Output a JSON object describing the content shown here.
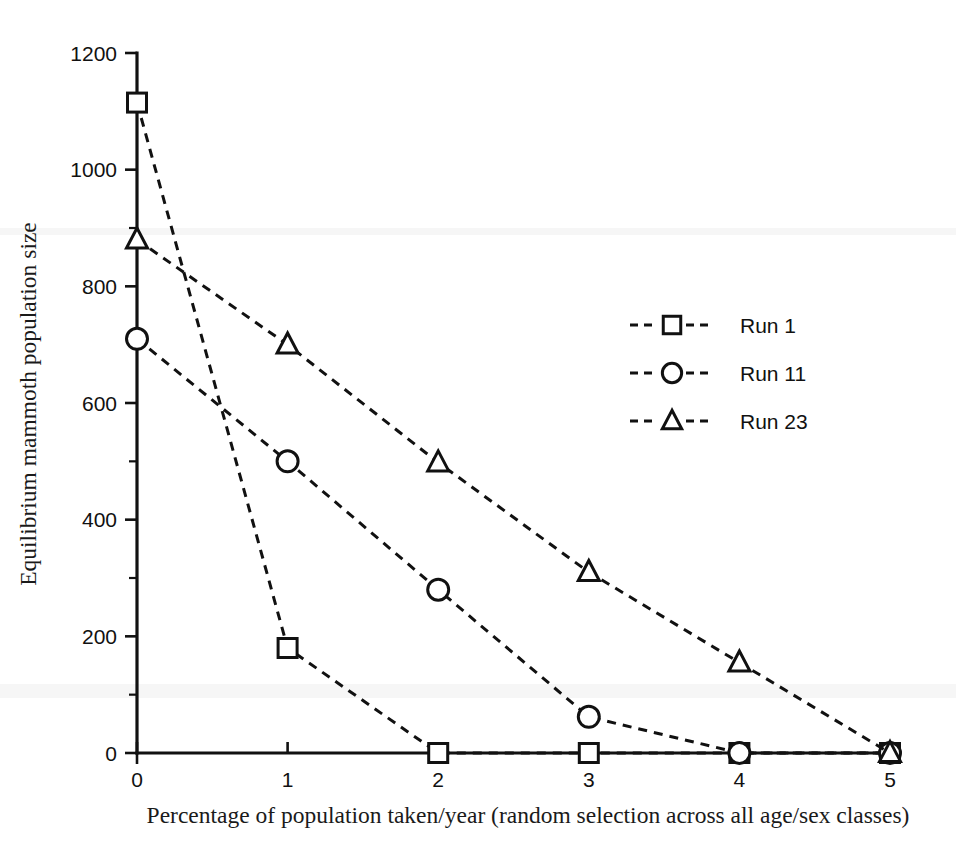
{
  "chart_data": {
    "type": "line",
    "title": "",
    "xlabel": "Percentage of population taken/year (random selection across all age/sex classes)",
    "ylabel": "Equilibrium mammoth population size",
    "x": [
      0,
      1,
      2,
      3,
      4,
      5
    ],
    "xlim": [
      0,
      5
    ],
    "ylim": [
      0,
      1200
    ],
    "xticks": [
      0,
      1,
      2,
      3,
      4,
      5
    ],
    "xticklabels": [
      "0",
      "1",
      "2",
      "3",
      "4",
      "5"
    ],
    "yticks": [
      0,
      200,
      400,
      600,
      800,
      1000,
      1200
    ],
    "yticklabels": [
      "0",
      "200",
      "400",
      "600",
      "800",
      "1000",
      "1200"
    ],
    "yticks_minor": [
      100,
      300,
      500,
      700,
      900,
      1100
    ],
    "grid": false,
    "legend_position": "center-right",
    "series": [
      {
        "name": "Run 1",
        "marker": "square",
        "linestyle": "dashed",
        "values": [
          1115,
          180,
          0,
          0,
          0,
          0
        ]
      },
      {
        "name": "Run 11",
        "marker": "circle",
        "linestyle": "dashed",
        "values": [
          710,
          500,
          280,
          62,
          0,
          0
        ]
      },
      {
        "name": "Run 23",
        "marker": "triangle",
        "linestyle": "dashed",
        "values": [
          880,
          700,
          498,
          310,
          155,
          0
        ]
      }
    ]
  },
  "legend": {
    "entries": [
      {
        "label": "Run 1",
        "marker": "square"
      },
      {
        "label": "Run 11",
        "marker": "circle"
      },
      {
        "label": "Run 23",
        "marker": "triangle"
      }
    ]
  },
  "colors": {
    "ink": "#111111",
    "paper": "#ffffff"
  }
}
